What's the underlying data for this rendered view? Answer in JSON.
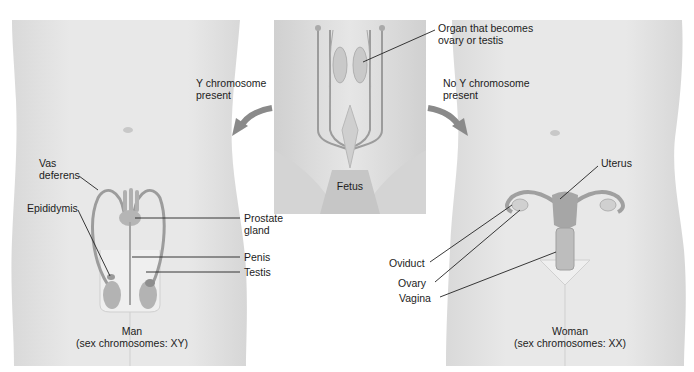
{
  "figure": {
    "colors": {
      "skin": "#e6e6e6",
      "skin_shadow": "#d2d2d2",
      "organ": "#a9a9a9",
      "organ_dark": "#8c8c8c",
      "arrow": "#8a8a8a",
      "leader_line": "#222222",
      "fetus_bg": "#dedede"
    }
  },
  "fetus": {
    "caption": "Fetus",
    "organ_label_line1": "Organ that becomes",
    "organ_label_line2": "ovary or testis"
  },
  "arrows": {
    "left_line1": "Y chromosome",
    "left_line2": "present",
    "right_line1": "No Y chromosome",
    "right_line2": "present"
  },
  "male": {
    "caption_line1": "Man",
    "caption_line2": "(sex chromosomes: XY)",
    "labels": {
      "vas_deferens_line1": "Vas",
      "vas_deferens_line2": "deferens",
      "epididymis": "Epididymis",
      "prostate_line1": "Prostate",
      "prostate_line2": "gland",
      "penis": "Penis",
      "testis": "Testis"
    }
  },
  "female": {
    "caption_line1": "Woman",
    "caption_line2": "(sex chromosomes: XX)",
    "labels": {
      "uterus": "Uterus",
      "oviduct": "Oviduct",
      "ovary": "Ovary",
      "vagina": "Vagina"
    }
  }
}
